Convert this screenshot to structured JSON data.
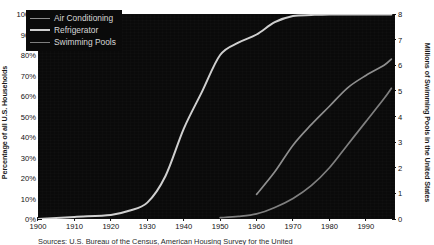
{
  "chart_data": {
    "type": "line",
    "title": "",
    "xlabel": "",
    "ylabel": "Percentage of all U.S. Households",
    "ylabel_right": "Millions of Swimming Pools in the United States",
    "xlim": [
      1900,
      1998
    ],
    "ylim": [
      0,
      100
    ],
    "ylim_right": [
      0,
      8
    ],
    "grid": false,
    "legend_position": "top-left",
    "background": "#0a0a0a",
    "xticks": [
      1900,
      1910,
      1920,
      1930,
      1940,
      1950,
      1960,
      1970,
      1980,
      1990
    ],
    "yticks_left": [
      "0%",
      "10%",
      "20%",
      "30%",
      "40%",
      "50%",
      "60%",
      "70%",
      "80%",
      "90%",
      "100%"
    ],
    "yticks_right": [
      0,
      1,
      2,
      3,
      4,
      5,
      6,
      7,
      8
    ],
    "series": [
      {
        "name": "Air Conditioning",
        "axis": "left",
        "unit": "percent",
        "color": "#8e8e8e",
        "x": [
          1960,
          1965,
          1970,
          1975,
          1980,
          1985,
          1990,
          1995,
          1997
        ],
        "values": [
          12,
          23,
          36,
          46,
          55,
          64,
          70,
          75,
          78
        ]
      },
      {
        "name": "Refrigerator",
        "axis": "left",
        "unit": "percent",
        "color": "#cfcfcf",
        "x": [
          1900,
          1910,
          1920,
          1925,
          1930,
          1935,
          1940,
          1945,
          1950,
          1955,
          1960,
          1965,
          1970,
          1975,
          1980,
          1990,
          1997
        ],
        "values": [
          0,
          1,
          2,
          4,
          8,
          21,
          44,
          62,
          80,
          86,
          90,
          96,
          99,
          99.5,
          99.8,
          99.8,
          99.8
        ]
      },
      {
        "name": "Swimming Pools",
        "axis": "right",
        "unit": "millions",
        "color": "#7f7f7f",
        "x": [
          1950,
          1955,
          1960,
          1965,
          1970,
          1975,
          1980,
          1985,
          1990,
          1995,
          1997
        ],
        "values": [
          0.05,
          0.1,
          0.2,
          0.45,
          0.8,
          1.3,
          2.0,
          2.9,
          3.8,
          4.7,
          5.1
        ]
      }
    ],
    "caption": "Sources: U.S. Bureau of the Census, American Housing Survey for the United"
  },
  "legend": {
    "items": [
      {
        "label": "Air Conditioning"
      },
      {
        "label": "Refrigerator"
      },
      {
        "label": "Swimming Pools"
      }
    ]
  }
}
